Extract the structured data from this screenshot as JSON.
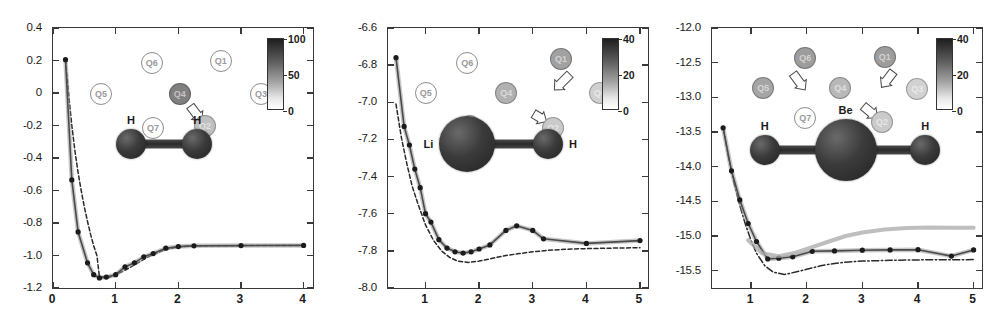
{
  "figure": {
    "panel_count": 3
  },
  "panels": [
    {
      "id": "h2",
      "molecule": {
        "name": "H2",
        "atoms": [
          {
            "label": "H",
            "x": 0.3,
            "y": 0.445,
            "r": 15
          },
          {
            "label": "H",
            "x": 0.555,
            "y": 0.445,
            "r": 15
          }
        ]
      },
      "axes": {
        "xlabel": "",
        "ylabel": "",
        "xlim": [
          0,
          4.15
        ],
        "ylim": [
          -1.2,
          0.4
        ],
        "xticks": [
          0,
          1,
          2,
          3,
          4
        ],
        "xticklabels": [
          "0",
          "1",
          "2",
          "3",
          "4"
        ],
        "yticks": [
          0.4,
          0.2,
          0,
          -0.2,
          -0.4,
          -0.6,
          -0.8,
          -1.0,
          -1.2
        ],
        "yticklabels": [
          "0.4",
          "0.2",
          "0",
          "-0.2",
          "-0.4",
          "-0.6",
          "-0.8",
          "-1.0",
          "-1.2"
        ]
      },
      "colorbar": {
        "min": 0,
        "max": 100,
        "ticks": [
          100,
          50,
          0
        ],
        "ticklabels": [
          "100",
          "50",
          "0"
        ]
      },
      "qubits": [
        {
          "label": "Q6",
          "x": 0.38,
          "y": 0.135,
          "style": "open",
          "shade": 0
        },
        {
          "label": "Q1",
          "x": 0.645,
          "y": 0.125,
          "style": "open",
          "shade": 0
        },
        {
          "label": "Q5",
          "x": 0.185,
          "y": 0.255,
          "style": "open",
          "shade": 0
        },
        {
          "label": "Q4",
          "x": 0.488,
          "y": 0.252,
          "style": "fill",
          "shade": 55
        },
        {
          "label": "Q3",
          "x": 0.8,
          "y": 0.255,
          "style": "open",
          "shade": 0
        },
        {
          "label": "Q7",
          "x": 0.385,
          "y": 0.385,
          "style": "open",
          "shade": 0
        },
        {
          "label": "Q2",
          "x": 0.585,
          "y": 0.375,
          "style": "fill",
          "shade": 22
        }
      ],
      "arrows": [
        {
          "x1": 0.528,
          "y1": 0.3,
          "x2": 0.572,
          "y2": 0.358
        }
      ]
    },
    {
      "id": "lih",
      "molecule": {
        "name": "LiH",
        "atoms": [
          {
            "label": "Li",
            "x": 0.305,
            "y": 0.445,
            "r": 28
          },
          {
            "label": "H",
            "x": 0.615,
            "y": 0.445,
            "r": 15
          }
        ]
      },
      "axes": {
        "xlabel": "",
        "ylabel": "",
        "xlim": [
          0.3,
          5.15
        ],
        "ylim": [
          -8.0,
          -6.6
        ],
        "xticks": [
          1,
          2,
          3,
          4,
          5
        ],
        "xticklabels": [
          "1",
          "2",
          "3",
          "4",
          "5"
        ],
        "yticks": [
          -6.6,
          -6.8,
          -7.0,
          -7.2,
          -7.4,
          -7.6,
          -7.8,
          -8.0
        ],
        "yticklabels": [
          "-6.6",
          "-6.8",
          "-7.0",
          "-7.2",
          "-7.4",
          "-7.6",
          "-7.8",
          "-8.0"
        ]
      },
      "colorbar": {
        "min": 0,
        "max": 40,
        "ticks": [
          40,
          20,
          0
        ],
        "ticklabels": [
          "40",
          "20",
          "0"
        ]
      },
      "qubits": [
        {
          "label": "Q6",
          "x": 0.305,
          "y": 0.135,
          "style": "open",
          "shade": 0
        },
        {
          "label": "Q1",
          "x": 0.665,
          "y": 0.12,
          "style": "fill",
          "shade": 38
        },
        {
          "label": "Q5",
          "x": 0.145,
          "y": 0.25,
          "style": "open",
          "shade": 0
        },
        {
          "label": "Q4",
          "x": 0.455,
          "y": 0.25,
          "style": "fill",
          "shade": 30
        },
        {
          "label": "Q3",
          "x": 0.815,
          "y": 0.25,
          "style": "fill",
          "shade": 14
        },
        {
          "label": "Q7",
          "x": 0.315,
          "y": 0.378,
          "style": "open",
          "shade": 0
        },
        {
          "label": "Q2",
          "x": 0.635,
          "y": 0.385,
          "style": "fill",
          "shade": 17
        }
      ],
      "arrows": [
        {
          "x1": 0.7,
          "y1": 0.178,
          "x2": 0.64,
          "y2": 0.238
        },
        {
          "x1": 0.56,
          "y1": 0.33,
          "x2": 0.61,
          "y2": 0.36
        }
      ]
    },
    {
      "id": "beh2",
      "molecule": {
        "name": "BeH2",
        "atoms": [
          {
            "label": "H",
            "x": 0.195,
            "y": 0.47,
            "r": 15
          },
          {
            "label": "Be",
            "x": 0.495,
            "y": 0.47,
            "r": 31
          },
          {
            "label": "H",
            "x": 0.79,
            "y": 0.47,
            "r": 15
          }
        ]
      },
      "axes": {
        "xlabel": "",
        "ylabel": "",
        "xlim": [
          0.3,
          5.15
        ],
        "ylim": [
          -15.75,
          -12.0
        ],
        "xticks": [
          1,
          2,
          3,
          4,
          5
        ],
        "xticklabels": [
          "1",
          "2",
          "3",
          "4",
          "5"
        ],
        "yticks": [
          -12.0,
          -12.5,
          -13.0,
          -13.5,
          -14.0,
          -14.5,
          -15.0,
          -15.5
        ],
        "yticklabels": [
          "-12.0",
          "-12.5",
          "-13.0",
          "-13.5",
          "-14.0",
          "-14.5",
          "-15.0",
          "-15.5"
        ]
      },
      "colorbar": {
        "min": 0,
        "max": 40,
        "ticks": [
          40,
          20,
          0
        ],
        "ticklabels": [
          "40",
          "20",
          "0"
        ]
      },
      "qubits": [
        {
          "label": "Q6",
          "x": 0.345,
          "y": 0.115,
          "style": "fill",
          "shade": 40
        },
        {
          "label": "Q1",
          "x": 0.64,
          "y": 0.11,
          "style": "fill",
          "shade": 40
        },
        {
          "label": "Q5",
          "x": 0.19,
          "y": 0.23,
          "style": "fill",
          "shade": 36
        },
        {
          "label": "Q4",
          "x": 0.475,
          "y": 0.232,
          "style": "fill",
          "shade": 26
        },
        {
          "label": "Q3",
          "x": 0.76,
          "y": 0.235,
          "style": "fill",
          "shade": 13
        },
        {
          "label": "Q7",
          "x": 0.345,
          "y": 0.345,
          "style": "open",
          "shade": 0
        },
        {
          "label": "Q2",
          "x": 0.63,
          "y": 0.36,
          "style": "fill",
          "shade": 17
        }
      ],
      "arrows": [
        {
          "x1": 0.3,
          "y1": 0.175,
          "x2": 0.345,
          "y2": 0.238
        },
        {
          "x1": 0.672,
          "y1": 0.168,
          "x2": 0.628,
          "y2": 0.228
        },
        {
          "x1": 0.56,
          "y1": 0.3,
          "x2": 0.612,
          "y2": 0.345
        }
      ]
    }
  ],
  "chart_data": [
    {
      "type": "line",
      "title": "H2 dissociation curve",
      "xlabel": "",
      "ylabel": "",
      "xlim": [
        0,
        4.15
      ],
      "ylim": [
        -1.2,
        0.4
      ],
      "grid": false,
      "legend": false,
      "series": [
        {
          "name": "exact",
          "style": "dashed",
          "x": [
            0.2,
            0.25,
            0.3,
            0.35,
            0.4,
            0.45,
            0.5,
            0.55,
            0.6,
            0.65,
            0.7,
            0.74,
            0.8,
            0.9,
            1.0,
            1.1,
            1.2,
            1.3,
            1.4,
            1.5,
            1.6,
            1.7,
            1.8,
            2.0,
            2.2,
            2.5,
            3.0,
            3.5,
            4.0
          ],
          "y": [
            0.205,
            -0.01,
            -0.2,
            -0.355,
            -0.49,
            -0.6,
            -0.7,
            -0.79,
            -0.87,
            -0.94,
            -1.0,
            -1.13,
            -1.132,
            -1.135,
            -1.118,
            -1.1,
            -1.08,
            -1.058,
            -1.035,
            -1.012,
            -0.995,
            -0.978,
            -0.962,
            -0.948,
            -0.942,
            -0.94,
            -0.939,
            -0.939,
            -0.939
          ]
        },
        {
          "name": "vqe",
          "style": "markers",
          "x": [
            0.2,
            0.3,
            0.4,
            0.55,
            0.65,
            0.74,
            0.85,
            1.0,
            1.15,
            1.3,
            1.45,
            1.6,
            1.8,
            2.0,
            2.25,
            3.0,
            4.0
          ],
          "y": [
            0.205,
            -0.535,
            -0.855,
            -1.045,
            -1.118,
            -1.138,
            -1.133,
            -1.118,
            -1.07,
            -1.045,
            -1.008,
            -0.988,
            -0.955,
            -0.945,
            -0.94,
            -0.939,
            -0.938
          ]
        }
      ]
    },
    {
      "type": "line",
      "title": "LiH dissociation curve",
      "xlabel": "",
      "ylabel": "",
      "xlim": [
        0.3,
        5.15
      ],
      "ylim": [
        -8.0,
        -6.6
      ],
      "grid": false,
      "legend": false,
      "series": [
        {
          "name": "exact",
          "style": "dashed",
          "x": [
            0.45,
            0.55,
            0.65,
            0.75,
            0.85,
            1.0,
            1.15,
            1.3,
            1.45,
            1.6,
            1.8,
            2.0,
            2.25,
            2.5,
            2.75,
            3.0,
            3.25,
            3.5,
            3.75,
            4.0,
            4.5,
            5.0
          ],
          "y": [
            -7.01,
            -7.19,
            -7.33,
            -7.45,
            -7.54,
            -7.66,
            -7.745,
            -7.8,
            -7.835,
            -7.855,
            -7.862,
            -7.855,
            -7.84,
            -7.825,
            -7.815,
            -7.805,
            -7.798,
            -7.793,
            -7.79,
            -7.788,
            -7.785,
            -7.783
          ]
        },
        {
          "name": "vqe",
          "style": "markers",
          "x": [
            0.45,
            0.6,
            0.7,
            0.8,
            0.9,
            1.0,
            1.1,
            1.25,
            1.4,
            1.55,
            1.7,
            1.85,
            2.0,
            2.2,
            2.5,
            2.7,
            3.0,
            3.2,
            4.0,
            5.0
          ],
          "y": [
            -6.76,
            -7.13,
            -7.23,
            -7.36,
            -7.46,
            -7.6,
            -7.645,
            -7.74,
            -7.785,
            -7.805,
            -7.812,
            -7.805,
            -7.79,
            -7.768,
            -7.69,
            -7.665,
            -7.69,
            -7.735,
            -7.76,
            -7.745
          ]
        }
      ]
    },
    {
      "type": "line",
      "title": "BeH2 dissociation curve",
      "xlabel": "",
      "ylabel": "",
      "xlim": [
        0.3,
        5.15
      ],
      "ylim": [
        -15.75,
        -12.0
      ],
      "grid": false,
      "legend": false,
      "series": [
        {
          "name": "exact",
          "style": "dash-dot",
          "x": [
            0.5,
            0.6,
            0.7,
            0.8,
            0.9,
            1.0,
            1.1,
            1.25,
            1.4,
            1.6,
            1.8,
            2.0,
            2.25,
            2.5,
            2.75,
            3.0,
            3.5,
            4.0,
            4.5,
            5.0
          ],
          "y": [
            -13.43,
            -13.88,
            -14.25,
            -14.56,
            -14.83,
            -15.06,
            -15.25,
            -15.43,
            -15.52,
            -15.555,
            -15.52,
            -15.48,
            -15.43,
            -15.395,
            -15.375,
            -15.362,
            -15.35,
            -15.345,
            -15.342,
            -15.34
          ]
        },
        {
          "name": "vqe",
          "style": "markers",
          "x": [
            0.5,
            0.65,
            0.8,
            0.95,
            1.1,
            1.3,
            1.5,
            1.75,
            2.1,
            2.5,
            3.0,
            3.5,
            4.0,
            4.6,
            5.0
          ],
          "y": [
            -13.44,
            -14.06,
            -14.48,
            -14.82,
            -15.08,
            -15.33,
            -15.32,
            -15.3,
            -15.22,
            -15.215,
            -15.205,
            -15.2,
            -15.198,
            -15.29,
            -15.2
          ]
        },
        {
          "name": "upper",
          "style": "band",
          "x": [
            0.95,
            1.2,
            1.5,
            1.8,
            2.1,
            2.4,
            2.7,
            3.0,
            3.4,
            3.8,
            4.2,
            4.6,
            5.0
          ],
          "y": [
            -15.06,
            -15.25,
            -15.29,
            -15.24,
            -15.16,
            -15.08,
            -15.0,
            -14.95,
            -14.905,
            -14.885,
            -14.878,
            -14.88,
            -14.88
          ]
        }
      ]
    }
  ]
}
